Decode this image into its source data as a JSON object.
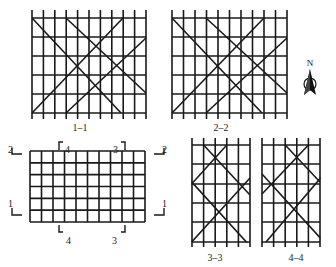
{
  "figure": {
    "background": "#ffffff",
    "line_color": "#1a1a1a"
  },
  "sections": [
    {
      "id": "1-1",
      "label": "1–1",
      "label_pos": [
        80,
        131
      ],
      "verticals_x": [
        32,
        43.4,
        54.8,
        66.2,
        77.6,
        89,
        100.4,
        111.8,
        123.2,
        134.6,
        146
      ],
      "vertical_extent": [
        10,
        119
      ],
      "horizontals_y": [
        18,
        37,
        56,
        75,
        94,
        113
      ],
      "horizontal_extent": [
        32,
        146
      ],
      "diagonals": [
        [
          32,
          18,
          121,
          113
        ],
        [
          66,
          18,
          146,
          93
        ],
        [
          32,
          113,
          123,
          18
        ],
        [
          66,
          113,
          146,
          38
        ]
      ]
    },
    {
      "id": "2-2",
      "label": "2–2",
      "label_pos": [
        221,
        131
      ],
      "verticals_x": [
        172,
        183.5,
        195,
        206.5,
        218,
        229.5,
        241,
        252.5,
        264,
        275.5,
        287
      ],
      "vertical_extent": [
        10,
        119
      ],
      "horizontals_y": [
        18,
        37,
        56,
        75,
        94,
        113
      ],
      "horizontal_extent": [
        172,
        287
      ],
      "diagonals": [
        [
          172,
          18,
          262,
          113
        ],
        [
          206,
          18,
          287,
          93
        ],
        [
          172,
          113,
          264,
          18
        ],
        [
          206,
          113,
          287,
          38
        ]
      ]
    },
    {
      "id": "3-3",
      "label": "3–3",
      "label_pos": [
        215,
        261
      ],
      "verticals_x": [
        192,
        203.6,
        215.2,
        226.8,
        238.4,
        250
      ],
      "vertical_extent": [
        138,
        247
      ],
      "horizontals_y": [
        145,
        164,
        184,
        203,
        222,
        242
      ],
      "horizontal_extent": [
        192,
        250
      ],
      "diagonals": [
        [
          203.6,
          145,
          250,
          195
        ],
        [
          226.8,
          145,
          188,
          188
        ],
        [
          188,
          178,
          250,
          246
        ],
        [
          250,
          178,
          188,
          246
        ]
      ]
    },
    {
      "id": "4-4",
      "label": "4–4",
      "label_pos": [
        296,
        261
      ],
      "verticals_x": [
        262,
        273.6,
        285.2,
        296.8,
        308.4,
        320
      ],
      "vertical_extent": [
        138,
        247
      ],
      "horizontals_y": [
        145,
        164,
        184,
        203,
        222,
        242
      ],
      "horizontal_extent": [
        262,
        320
      ],
      "diagonals": [
        [
          285.2,
          145,
          320,
          182
        ],
        [
          308.4,
          145,
          262,
          194
        ],
        [
          262,
          174,
          324,
          242
        ],
        [
          324,
          174,
          266,
          242
        ]
      ]
    }
  ],
  "plan": {
    "id": "plan",
    "columns": 10,
    "rows": 6,
    "x": [
      30,
      145
    ],
    "y": [
      151,
      222
    ],
    "markers": [
      {
        "label": "2",
        "side": "left",
        "corner": [
          10,
          151
        ],
        "text_pos": [
          8,
          145
        ],
        "path": "M12 148 L12 154 L22 154"
      },
      {
        "label": "2",
        "side": "right",
        "corner": [
          160,
          151
        ],
        "text_pos": [
          162,
          145
        ],
        "path": "M164 148 L164 154 L154 154"
      },
      {
        "label": "1",
        "side": "left",
        "corner": [
          10,
          215
        ],
        "text_pos": [
          8,
          199
        ],
        "path": "M12 208 L12 215 L22 215"
      },
      {
        "label": "1",
        "side": "right",
        "corner": [
          160,
          215
        ],
        "text_pos": [
          162,
          199
        ],
        "path": "M164 208 L164 215 L154 215"
      },
      {
        "label": "4",
        "side": "top",
        "text_pos": [
          65,
          145
        ],
        "path": "M59 150 L59 142 L63 142"
      },
      {
        "label": "3",
        "side": "top",
        "text_pos": [
          113,
          145
        ],
        "path": "M121 142 L125 142 L125 150"
      },
      {
        "label": "4",
        "side": "bottom",
        "text_pos": [
          66,
          236
        ],
        "path": "M59 225 L59 232 L63 232"
      },
      {
        "label": "3",
        "side": "bottom",
        "text_pos": [
          112,
          236
        ],
        "path": "M121 232 L125 232 L125 225"
      }
    ]
  },
  "north_arrow": {
    "label": "N",
    "position": [
      310,
      82
    ]
  }
}
